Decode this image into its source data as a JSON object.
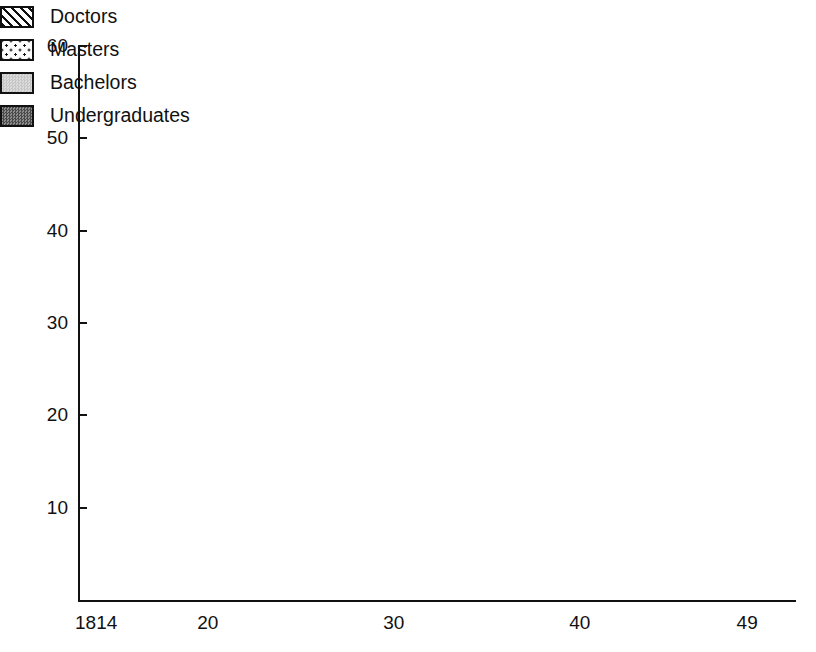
{
  "chart_data": {
    "type": "bar",
    "title": "",
    "subtitle": "",
    "xlabel": "",
    "ylabel": "",
    "stacked": true,
    "grid": false,
    "ylim": [
      0,
      60
    ],
    "yticks": [
      10,
      20,
      30,
      40,
      50,
      60
    ],
    "ytick_labels": [
      "10",
      "20",
      "30",
      "40",
      "50",
      "60"
    ],
    "xlim_years": [
      1814,
      1849
    ],
    "xtick_years": [
      1814,
      1820,
      1830,
      1840,
      1849
    ],
    "xtick_labels": [
      "1814",
      "20",
      "30",
      "40",
      "49"
    ],
    "legend_position": "upper right",
    "categories": [
      "1814",
      "1815",
      "1816",
      "1817",
      "1818",
      "1819",
      "1820",
      "1821",
      "1822",
      "1823",
      "1824",
      "1825",
      "1826",
      "1827",
      "1828",
      "1829",
      "1830",
      "1831",
      "1832",
      "1833",
      "1834",
      "1835",
      "1836",
      "1837",
      "1838",
      "1839",
      "1840",
      "1841",
      "1842",
      "1843",
      "1844",
      "1845",
      "1846",
      "1847",
      "1848",
      "1849"
    ],
    "series": [
      {
        "name": "Undergraduates",
        "color": "#6e6e6e",
        "pattern": "dense-dark-checker",
        "values": [
          17.5,
          12,
          7,
          10,
          17.5,
          5,
          2,
          8.5,
          9,
          22.5,
          3,
          10.5,
          15.5,
          17.5,
          14.5,
          15,
          10.5,
          23.5,
          12.5,
          6,
          6,
          9,
          5,
          8,
          8.5,
          6,
          4.5,
          3,
          0,
          0,
          2,
          0,
          0,
          0,
          0,
          0
        ]
      },
      {
        "name": "Bachelors",
        "color": "#d3d3d3",
        "pattern": "light-grey",
        "values": [
          10.5,
          10,
          10,
          13,
          11.5,
          15,
          10,
          8.5,
          13.5,
          17,
          3,
          13.5,
          6,
          10.5,
          6,
          6,
          10,
          0,
          15.5,
          3.5,
          3.5,
          0.5,
          4,
          0,
          5.5,
          3,
          2.5,
          2,
          0,
          0,
          9.5,
          0,
          2.5,
          3.5,
          0,
          0
        ]
      },
      {
        "name": "Masters",
        "color": "#fbfbfb",
        "pattern": "sparse-dots",
        "values": [
          24.5,
          20,
          14.5,
          32,
          26.5,
          14,
          11,
          18,
          22.5,
          5.5,
          2,
          9,
          5.5,
          10,
          6,
          6,
          6.5,
          4,
          0,
          8.5,
          0,
          3,
          16.5,
          5.5,
          0,
          0,
          2,
          4,
          6,
          0,
          0,
          0,
          9,
          1,
          0,
          6
        ]
      },
      {
        "name": "Doctors",
        "color": "#ffffff",
        "pattern": "diagonal-hatch",
        "values": [
          1.5,
          2,
          1.5,
          2,
          0.5,
          0,
          1,
          0,
          0,
          0,
          1,
          0,
          0,
          2,
          0,
          0,
          0,
          0.5,
          0,
          0,
          0,
          0,
          0,
          1,
          0,
          0,
          0,
          0,
          0,
          0,
          0,
          0,
          0,
          0,
          0,
          0
        ]
      }
    ],
    "totals": [
      54,
      44,
      33,
      57,
      56,
      34,
      24,
      35,
      45,
      45,
      9,
      33,
      27,
      40,
      26.5,
      27,
      27,
      31.5,
      28,
      18,
      9.5,
      12.5,
      26,
      14.5,
      14,
      9,
      9,
      9,
      6,
      0,
      11.5,
      0,
      11.5,
      4.5,
      0,
      6
    ]
  },
  "legend": {
    "items": [
      {
        "label": "Doctors",
        "swatch": "doctors-swatch"
      },
      {
        "label": "Masters",
        "swatch": "masters-swatch"
      },
      {
        "label": "Bachelors",
        "swatch": "bachelors-swatch"
      },
      {
        "label": "Undergraduates",
        "swatch": "undergraduates-swatch"
      }
    ]
  }
}
